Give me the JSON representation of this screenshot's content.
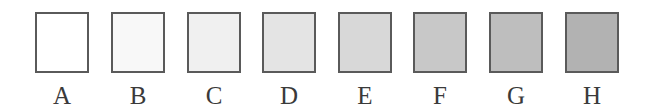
{
  "figure": {
    "border_color": "#5a5a5a",
    "swatches": [
      {
        "label": "A",
        "fill": "#ffffff"
      },
      {
        "label": "B",
        "fill": "#f8f8f8"
      },
      {
        "label": "C",
        "fill": "#f0f0f0"
      },
      {
        "label": "D",
        "fill": "#e4e4e4"
      },
      {
        "label": "E",
        "fill": "#d8d8d8"
      },
      {
        "label": "F",
        "fill": "#c8c8c8"
      },
      {
        "label": "G",
        "fill": "#bebebe"
      },
      {
        "label": "H",
        "fill": "#b2b2b2"
      }
    ]
  }
}
